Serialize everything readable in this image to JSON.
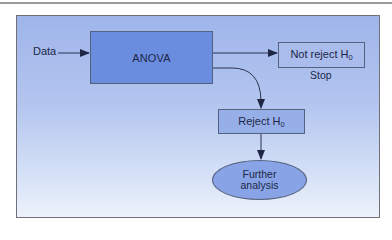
{
  "diagram": {
    "type": "flowchart",
    "input_label": "Data",
    "nodes": {
      "anova": {
        "label": "ANOVA",
        "shape": "rectangle",
        "color": "#6a8de0"
      },
      "not_reject": {
        "label": "Not reject H",
        "subscript": "0",
        "shape": "rectangle",
        "color": "#a9bcec",
        "caption": "Stop"
      },
      "reject": {
        "label": "Reject H",
        "subscript": "0",
        "shape": "rectangle",
        "color": "#97afe8"
      },
      "further": {
        "line1": "Further",
        "line2": "analysis",
        "shape": "ellipse",
        "color": "#88a4e6"
      }
    },
    "edges": [
      {
        "from": "Data",
        "to": "ANOVA"
      },
      {
        "from": "ANOVA",
        "to": "Not reject H0"
      },
      {
        "from": "ANOVA",
        "to": "Reject H0",
        "style": "curved"
      },
      {
        "from": "Reject H0",
        "to": "Further analysis"
      }
    ],
    "colors": {
      "background_top": "#9fb5ea",
      "background_bottom": "#edf2fb",
      "stroke": "#55627f",
      "arrow": "#2a3350"
    }
  }
}
